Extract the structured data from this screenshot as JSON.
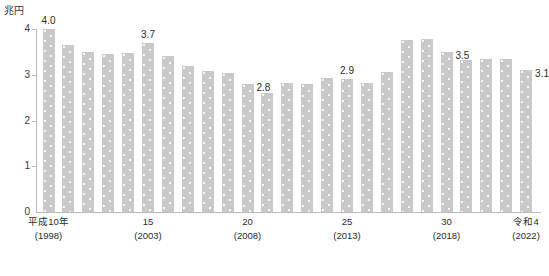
{
  "unit": "兆円",
  "axis": {
    "y_ticks": [
      "0",
      "1",
      "2",
      "3",
      "4"
    ],
    "y_min": 0,
    "y_max": 4
  },
  "x_labels": [
    {
      "line1": "平成10年",
      "line2": "(1998)",
      "index": 0
    },
    {
      "line1": "15",
      "line2": "(2003)",
      "index": 5
    },
    {
      "line1": "20",
      "line2": "(2008)",
      "index": 10
    },
    {
      "line1": "25",
      "line2": "(2013)",
      "index": 15
    },
    {
      "line1": "30",
      "line2": "(2018)",
      "index": 20
    },
    {
      "line1": "令和4",
      "line2": "(2022)",
      "index": 24
    }
  ],
  "value_labels": [
    {
      "index": 0,
      "text": "4.0",
      "side": "center"
    },
    {
      "index": 5,
      "text": "3.7",
      "side": "center"
    },
    {
      "index": 10,
      "text": "2.8",
      "side": "right"
    },
    {
      "index": 15,
      "text": "2.9",
      "side": "center"
    },
    {
      "index": 20,
      "text": "3.5",
      "side": "right"
    },
    {
      "index": 24,
      "text": "3.1",
      "side": "right"
    }
  ],
  "colors": {
    "bar": "#c9c9c9",
    "axis": "#b9b9b9",
    "text": "#2b2b2b",
    "background": "#ffffff"
  },
  "chart_data": {
    "type": "bar",
    "title": "",
    "xlabel": "",
    "ylabel": "兆円",
    "ylim": [
      0,
      4
    ],
    "grid": false,
    "legend": "none",
    "yticks": [
      0,
      1,
      2,
      3,
      4
    ],
    "categories": [
      "平成10年(1998)",
      "11(1999)",
      "12(2000)",
      "13(2001)",
      "14(2002)",
      "15(2003)",
      "16(2004)",
      "17(2005)",
      "18(2006)",
      "19(2007)",
      "20(2008)",
      "21(2009)",
      "22(2010)",
      "23(2011)",
      "24(2012)",
      "25(2013)",
      "26(2014)",
      "27(2015)",
      "28(2016)",
      "29(2017)",
      "30(2018)",
      "令和元(2019)",
      "2(2020)",
      "3(2021)",
      "令和4(2022)"
    ],
    "x": [
      1998,
      1999,
      2000,
      2001,
      2002,
      2003,
      2004,
      2005,
      2006,
      2007,
      2008,
      2009,
      2010,
      2011,
      2012,
      2013,
      2014,
      2015,
      2016,
      2017,
      2018,
      2019,
      2020,
      2021,
      2022
    ],
    "values": [
      4.0,
      3.65,
      3.5,
      3.45,
      3.47,
      3.7,
      3.4,
      3.2,
      3.08,
      3.03,
      2.8,
      2.6,
      2.83,
      2.79,
      2.93,
      2.9,
      2.83,
      3.07,
      3.75,
      3.78,
      3.5,
      3.33,
      3.35,
      3.34,
      3.1
    ],
    "annotations": [
      {
        "x": 1998,
        "y": 4.0,
        "text": "4.0"
      },
      {
        "x": 2003,
        "y": 3.7,
        "text": "3.7"
      },
      {
        "x": 2008,
        "y": 2.8,
        "text": "2.8"
      },
      {
        "x": 2013,
        "y": 2.9,
        "text": "2.9"
      },
      {
        "x": 2018,
        "y": 3.5,
        "text": "3.5"
      },
      {
        "x": 2022,
        "y": 3.1,
        "text": "3.1"
      }
    ]
  }
}
